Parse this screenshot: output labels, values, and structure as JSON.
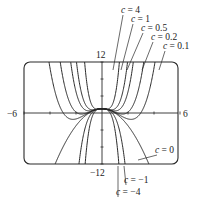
{
  "figure": {
    "window": {
      "xmin": -6,
      "xmax": 6,
      "ymin": -12,
      "ymax": 12
    },
    "tick_labels": {
      "xmin": "−6",
      "xmax": "6",
      "ymax": "12",
      "ymin": "−12"
    },
    "line_color": "#2a2a2a"
  },
  "chart_data": {
    "type": "line",
    "title": "",
    "xlabel": "",
    "ylabel": "",
    "xlim": [
      -6,
      6
    ],
    "ylim": [
      -12,
      12
    ],
    "function": "y = c x^4 - x^2",
    "series": [
      {
        "name": "c = 4",
        "c": 4
      },
      {
        "name": "c = 1",
        "c": 1
      },
      {
        "name": "c = 0.5",
        "c": 0.5
      },
      {
        "name": "c = 0.2",
        "c": 0.2
      },
      {
        "name": "c = 0.1",
        "c": 0.1
      },
      {
        "name": "c = 0",
        "c": 0
      },
      {
        "name": "c = −1",
        "c": -1
      },
      {
        "name": "c = −4",
        "c": -4
      }
    ]
  },
  "annotations": {
    "top": [
      {
        "text": "c = 4",
        "x": 121,
        "y": 13,
        "tx": 113,
        "ty": 70
      },
      {
        "text": "c = 1",
        "x": 131,
        "y": 22,
        "tx": 121,
        "ty": 70
      },
      {
        "text": "c = 0.5",
        "x": 141,
        "y": 31,
        "tx": 127,
        "ty": 70
      },
      {
        "text": "c = 0.2",
        "x": 151,
        "y": 40,
        "tx": 142,
        "ty": 70
      },
      {
        "text": "c = 0.1",
        "x": 163,
        "y": 49,
        "tx": 159,
        "ty": 70
      }
    ],
    "bottom": [
      {
        "text": "c = 0",
        "x": 155,
        "y": 153,
        "tx": 138,
        "ty": 160
      },
      {
        "text": "c = −1",
        "x": 124,
        "y": 183,
        "tx": 124,
        "ty": 166
      },
      {
        "text": "c = −4",
        "x": 116,
        "y": 195,
        "tx": 118,
        "ty": 166
      }
    ]
  }
}
